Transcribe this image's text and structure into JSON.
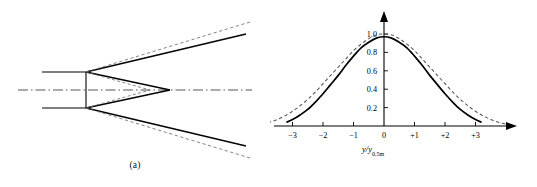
{
  "figure": {
    "panel_a": {
      "caption": "(a)",
      "description": "free-jet spreading schematic with nozzle exit, potential core and mixing-layer boundaries",
      "centerline_style": "dash-dot",
      "solid_line_label": "measured boundary",
      "dashed_line_label": "theoretical boundary"
    },
    "panel_b": {
      "caption": "(b)",
      "ylabel": {
        "numerator_top": "u",
        "numerator_bottom": "u",
        "numerator_bottom_sub": "m",
        "divider": "/",
        "denominator_top": "ΔT",
        "denominator_bottom": "ΔT",
        "denominator_bottom_sub": "m"
      },
      "xlabel": {
        "main": "y/y",
        "sub": "0.5m"
      }
    }
  },
  "chart_data": {
    "type": "line",
    "title": "",
    "xlabel": "y/y0.5m",
    "ylabel": "u/um  /  ΔT/ΔTm",
    "xlim": [
      -4.3,
      4.0
    ],
    "ylim": [
      0,
      1.12
    ],
    "grid": false,
    "legend_position": "none",
    "xticks": [
      -4,
      -3,
      -2,
      -1,
      0,
      1,
      2,
      3
    ],
    "xticklabels": [
      "−4",
      "−3",
      "−2",
      "−1",
      "0",
      "+1",
      "+2",
      "+3"
    ],
    "yticks": [
      0.2,
      0.4,
      0.6,
      0.8,
      1.0
    ],
    "yticklabels": [
      "0.2",
      "0.4",
      "0.6",
      "0.8",
      "1.0"
    ],
    "series": [
      {
        "name": "velocity profile u/um",
        "style": "solid",
        "color": "#000000",
        "peak_value": 0.97,
        "x": [
          -3.2,
          -3.0,
          -2.75,
          -2.5,
          -2.25,
          -2.0,
          -1.75,
          -1.5,
          -1.25,
          -1.0,
          -0.75,
          -0.5,
          -0.25,
          0.0,
          0.25,
          0.5,
          0.75,
          1.0,
          1.25,
          1.5,
          1.75,
          2.0,
          2.25,
          2.5,
          2.75,
          3.0,
          3.2
        ],
        "values": [
          0.04,
          0.07,
          0.12,
          0.18,
          0.26,
          0.35,
          0.45,
          0.55,
          0.66,
          0.76,
          0.85,
          0.91,
          0.955,
          0.97,
          0.955,
          0.91,
          0.85,
          0.76,
          0.66,
          0.55,
          0.45,
          0.35,
          0.26,
          0.18,
          0.12,
          0.07,
          0.04
        ]
      },
      {
        "name": "temperature profile ΔT/ΔTm",
        "style": "dashed",
        "color": "#555555",
        "peak_value": 1.0,
        "x": [
          -4.0,
          -3.75,
          -3.5,
          -3.25,
          -3.0,
          -2.75,
          -2.5,
          -2.25,
          -2.0,
          -1.75,
          -1.5,
          -1.25,
          -1.0,
          -0.75,
          -0.5,
          -0.25,
          0.0,
          0.25,
          0.5,
          0.75,
          1.0,
          1.25,
          1.5,
          1.75,
          2.0,
          2.25,
          2.5,
          2.75,
          3.0,
          3.25,
          3.5,
          3.75,
          4.0
        ],
        "values": [
          0.02,
          0.04,
          0.07,
          0.11,
          0.16,
          0.22,
          0.29,
          0.37,
          0.46,
          0.55,
          0.64,
          0.73,
          0.82,
          0.89,
          0.95,
          0.99,
          1.0,
          0.99,
          0.95,
          0.89,
          0.82,
          0.73,
          0.64,
          0.55,
          0.46,
          0.37,
          0.29,
          0.22,
          0.16,
          0.11,
          0.07,
          0.04,
          0.02
        ]
      }
    ]
  },
  "colors": {
    "solid_curve": "#000000",
    "dashed_curve": "#555555",
    "axis": "#000000",
    "background": "#ffffff"
  }
}
